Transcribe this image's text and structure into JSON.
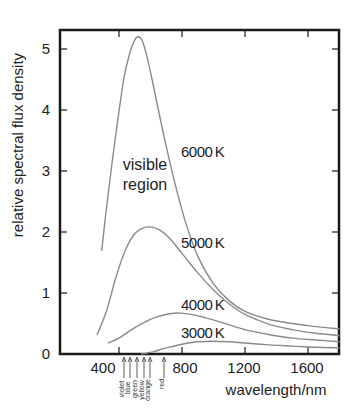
{
  "chart_data": {
    "type": "line",
    "title": "",
    "xlabel": "wavelength/nm",
    "ylabel": "relative spectral flux density",
    "xlim": [
      20,
      1800
    ],
    "ylim": [
      0,
      5.4
    ],
    "xticks": [
      400,
      800,
      1200,
      1600
    ],
    "yticks": [
      0,
      1,
      2,
      3,
      4,
      5
    ],
    "grid": false,
    "legend": "inline labels",
    "series": [
      {
        "name": "6000 K",
        "label": "6000 K",
        "x": [
          290,
          330,
          380,
          430,
          470,
          500,
          520,
          545,
          575,
          610,
          650,
          700,
          760,
          830,
          900,
          1000,
          1100,
          1200,
          1350,
          1500,
          1650,
          1800
        ],
        "y": [
          1.69,
          2.6,
          3.6,
          4.5,
          4.95,
          5.15,
          5.2,
          5.15,
          4.9,
          4.5,
          4.0,
          3.4,
          2.75,
          2.1,
          1.6,
          1.15,
          0.87,
          0.7,
          0.57,
          0.5,
          0.45,
          0.41
        ]
      },
      {
        "name": "5000 K",
        "label": "5000 K",
        "x": [
          260,
          320,
          380,
          440,
          500,
          560,
          610,
          660,
          720,
          800,
          900,
          1000,
          1100,
          1200,
          1350,
          1500,
          1650,
          1800
        ],
        "y": [
          0.31,
          0.7,
          1.25,
          1.7,
          1.97,
          2.07,
          2.08,
          2.03,
          1.9,
          1.65,
          1.33,
          1.05,
          0.82,
          0.65,
          0.49,
          0.4,
          0.34,
          0.3
        ]
      },
      {
        "name": "4000 K",
        "label": "4000 K",
        "x": [
          330,
          400,
          480,
          560,
          640,
          720,
          790,
          860,
          940,
          1050,
          1200,
          1350,
          1500,
          1650,
          1800
        ],
        "y": [
          0.18,
          0.26,
          0.4,
          0.52,
          0.61,
          0.66,
          0.67,
          0.65,
          0.6,
          0.52,
          0.4,
          0.32,
          0.26,
          0.23,
          0.2
        ]
      },
      {
        "name": "3000 K",
        "label": "3000 K",
        "x": [
          540,
          620,
          700,
          800,
          900,
          1000,
          1100,
          1200,
          1350,
          1500,
          1650,
          1800
        ],
        "y": [
          0.0,
          0.04,
          0.1,
          0.16,
          0.2,
          0.21,
          0.2,
          0.18,
          0.15,
          0.13,
          0.11,
          0.1
        ]
      }
    ],
    "annotations": [
      {
        "text_lines": [
          "visible",
          "region"
        ],
        "x_nm": 500,
        "y": 3.0
      },
      {
        "text": "6000 K",
        "x_nm": 760,
        "y": 3.3
      },
      {
        "text": "5000 K",
        "x_nm": 760,
        "y": 1.7
      },
      {
        "text": "4000 K",
        "x_nm": 760,
        "y": 0.7
      },
      {
        "text": "3000 K",
        "x_nm": 760,
        "y": 0.3
      }
    ],
    "visible_band_markers": [
      {
        "label": "violet",
        "x_nm": 420
      },
      {
        "label": "blue",
        "x_nm": 460
      },
      {
        "label": "green",
        "x_nm": 520
      },
      {
        "label": "yellow",
        "x_nm": 575
      },
      {
        "label": "orange",
        "x_nm": 610
      },
      {
        "label": "red",
        "x_nm": 700
      }
    ]
  },
  "labels": {
    "ylabel": "relative spectral flux density",
    "xlabel": "wavelength/nm",
    "visible_line1": "visible",
    "visible_line2": "region",
    "s6000": "6000 K",
    "s5000": "5000 K",
    "s4000": "4000 K",
    "s3000": "3000 K",
    "ytick0": "0",
    "ytick1": "1",
    "ytick2": "2",
    "ytick3": "3",
    "ytick4": "4",
    "ytick5": "5",
    "xtick400": "400",
    "xtick800": "800",
    "xtick1200": "1200",
    "xtick1600": "1600",
    "violet": "violet",
    "blue": "blue",
    "green": "green",
    "yellow": "yellow",
    "orange": "orange",
    "red": "red"
  }
}
